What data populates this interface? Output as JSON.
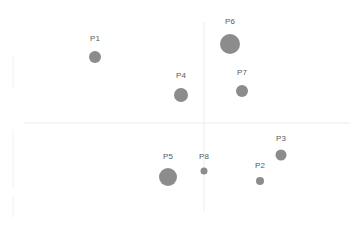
{
  "chart_data": {
    "type": "scatter",
    "subtype": "bubble",
    "title": "",
    "xlabel": "",
    "ylabel": "",
    "grid": false,
    "legend": null,
    "axes": {
      "color": "#ececec",
      "vertical": {
        "x": 204,
        "y1": 22,
        "y2": 212
      },
      "horizontal": {
        "y": 123,
        "x1": 24,
        "x2": 350
      },
      "left_ticks": [
        {
          "y1": 55,
          "y2": 88
        },
        {
          "y1": 130,
          "y2": 188
        },
        {
          "y1": 196,
          "y2": 218
        }
      ]
    },
    "bubble_color": "#8c8c8c",
    "label_color": "#5a5a5a",
    "points": [
      {
        "label": "P1",
        "cx": 95,
        "cy": 57,
        "r": 6,
        "ly": 41
      },
      {
        "label": "P2",
        "cx": 260,
        "cy": 181,
        "r": 4,
        "ly": 168
      },
      {
        "label": "P3",
        "cx": 281,
        "cy": 155,
        "r": 5.5,
        "ly": 141
      },
      {
        "label": "P4",
        "cx": 181,
        "cy": 95,
        "r": 7,
        "ly": 78
      },
      {
        "label": "P5",
        "cx": 168,
        "cy": 177,
        "r": 9,
        "ly": 159
      },
      {
        "label": "P6",
        "cx": 230,
        "cy": 44,
        "r": 10,
        "ly": 24
      },
      {
        "label": "P7",
        "cx": 242,
        "cy": 91,
        "r": 6,
        "ly": 75
      },
      {
        "label": "P8",
        "cx": 204,
        "cy": 171,
        "r": 3.5,
        "ly": 159
      }
    ]
  }
}
